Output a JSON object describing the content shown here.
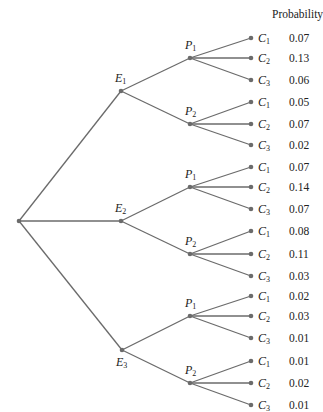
{
  "header": {
    "probability_label": "Probability"
  },
  "tree": {
    "root": {
      "x": 19,
      "y": 221
    },
    "events": [
      {
        "label": "E",
        "sub": "1",
        "x": 121,
        "y": 91,
        "label_pos": "above",
        "branches": [
          {
            "label": "P",
            "sub": "1",
            "x": 190,
            "y": 58,
            "leaves": [
              {
                "label": "C",
                "sub": "1",
                "y": 38,
                "prob": "0.07"
              },
              {
                "label": "C",
                "sub": "2",
                "y": 58,
                "prob": "0.13"
              },
              {
                "label": "C",
                "sub": "3",
                "y": 80,
                "prob": "0.06"
              }
            ]
          },
          {
            "label": "P",
            "sub": "2",
            "x": 190,
            "y": 124,
            "leaves": [
              {
                "label": "C",
                "sub": "1",
                "y": 102,
                "prob": "0.05"
              },
              {
                "label": "C",
                "sub": "2",
                "y": 124,
                "prob": "0.07"
              },
              {
                "label": "C",
                "sub": "3",
                "y": 145,
                "prob": "0.02"
              }
            ]
          }
        ]
      },
      {
        "label": "E",
        "sub": "2",
        "x": 121,
        "y": 221,
        "label_pos": "above",
        "branches": [
          {
            "label": "P",
            "sub": "1",
            "x": 190,
            "y": 187,
            "leaves": [
              {
                "label": "C",
                "sub": "1",
                "y": 167,
                "prob": "0.07"
              },
              {
                "label": "C",
                "sub": "2",
                "y": 187,
                "prob": "0.14"
              },
              {
                "label": "C",
                "sub": "3",
                "y": 209,
                "prob": "0.07"
              }
            ]
          },
          {
            "label": "P",
            "sub": "2",
            "x": 190,
            "y": 254,
            "leaves": [
              {
                "label": "C",
                "sub": "1",
                "y": 231,
                "prob": "0.08"
              },
              {
                "label": "C",
                "sub": "2",
                "y": 254,
                "prob": "0.11"
              },
              {
                "label": "C",
                "sub": "3",
                "y": 276,
                "prob": "0.03"
              }
            ]
          }
        ]
      },
      {
        "label": "E",
        "sub": "3",
        "x": 122,
        "y": 350,
        "label_pos": "below",
        "branches": [
          {
            "label": "P",
            "sub": "1",
            "x": 190,
            "y": 316,
            "leaves": [
              {
                "label": "C",
                "sub": "1",
                "y": 296,
                "prob": "0.02"
              },
              {
                "label": "C",
                "sub": "2",
                "y": 316,
                "prob": "0.03"
              },
              {
                "label": "C",
                "sub": "3",
                "y": 338,
                "prob": "0.01"
              }
            ]
          },
          {
            "label": "P",
            "sub": "2",
            "x": 190,
            "y": 383,
            "leaves": [
              {
                "label": "C",
                "sub": "1",
                "y": 361,
                "prob": "0.01"
              },
              {
                "label": "C",
                "sub": "2",
                "y": 383,
                "prob": "0.02"
              },
              {
                "label": "C",
                "sub": "3",
                "y": 405,
                "prob": "0.01"
              }
            ]
          }
        ]
      }
    ],
    "leaf_x": 251
  },
  "colors": {
    "line": "#6b6b6b",
    "node": "#6b6b6b",
    "text": "#222222"
  }
}
